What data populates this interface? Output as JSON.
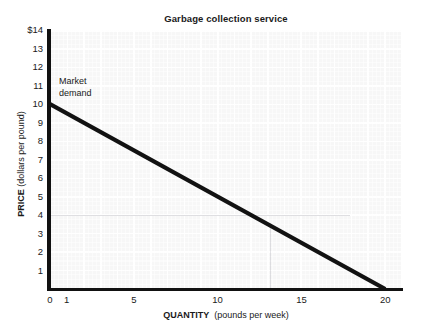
{
  "page": {
    "cropped_header_sliver": ""
  },
  "chart_data": {
    "type": "line",
    "title": "Garbage collection service",
    "xlabel_bold": "QUANTITY",
    "xlabel_rest": "(pounds per week)",
    "ylabel_bold": "PRICE",
    "ylabel_rest": "(dollars per pound)",
    "xlim": [
      0,
      21
    ],
    "ylim": [
      0,
      14
    ],
    "xticks": [
      0,
      1,
      5,
      10,
      15,
      20
    ],
    "xtick_labels": [
      "0",
      "1",
      "5",
      "10",
      "15",
      "20"
    ],
    "yticks": [
      1,
      2,
      3,
      4,
      5,
      6,
      7,
      8,
      9,
      10,
      11,
      12,
      13,
      14
    ],
    "ytick_labels": [
      "1",
      "2",
      "3",
      "4",
      "5",
      "6",
      "7",
      "8",
      "9",
      "10",
      "11",
      "12",
      "13",
      "14"
    ],
    "ytick_top_label": "$14",
    "grid": true,
    "legend": "none",
    "series": [
      {
        "name": "Market demand",
        "x": [
          0,
          20
        ],
        "y": [
          10,
          0
        ],
        "color": "#121212",
        "linewidth": 4.2
      }
    ],
    "annotations": [
      {
        "text_line1": "Market",
        "text_line2": "demand",
        "x": 0.6,
        "y": 11.3
      }
    ]
  },
  "colors": {
    "plot_background": "#f7f7f7",
    "axis": "#111111",
    "curve": "#121212",
    "grid": "#ffffff",
    "page": "#ffffff"
  }
}
